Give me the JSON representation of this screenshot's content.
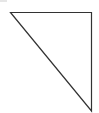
{
  "diagram": {
    "shape": "right-triangle",
    "stroke_color": "#333333",
    "fill_color": "none",
    "corner_mark_color": "#e6e6e6"
  }
}
